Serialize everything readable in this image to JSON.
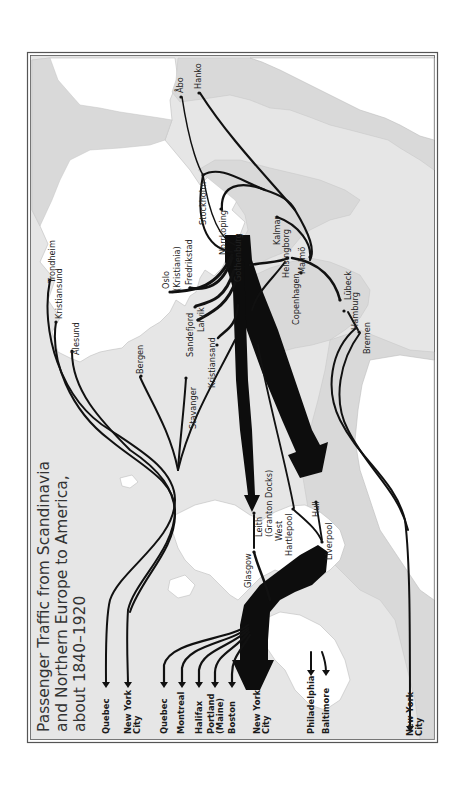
{
  "map": {
    "title_lines": [
      "Passenger Traffic from Scandinavia",
      "and Northern Europe to America,",
      "about 1840–1920"
    ],
    "orientation": "rotated 90° counter-clockwise",
    "colors": {
      "sea": "#e6e6e6",
      "land_scandinavia": "#ffffff",
      "land_continent": "#d9d9d9",
      "routes": "#111111",
      "frame": "#555555"
    },
    "ports": {
      "finland": [
        "Åbo",
        "Hanko"
      ],
      "sweden": [
        "Stockholm",
        "Norrköping",
        "Gothenburg",
        "Kalmar",
        "Helsingborg",
        "Malmö"
      ],
      "denmark": [
        "Copenhagen"
      ],
      "germany": [
        "Lübeck",
        "Hamburg",
        "Bremen"
      ],
      "norway": [
        "Trondheim",
        "Kristiansund",
        "Ålesund",
        "Bergen",
        "Stavanger",
        "Kristiansand",
        "Larvik",
        "Sandefjord",
        "Fredrikstad"
      ],
      "oslo": "Oslo",
      "oslo_alt": "(Kristiania)",
      "britain": [
        "Glasgow",
        "Leith",
        "(Granton Docks)",
        "West",
        "Hartlepool",
        "Hull",
        "Liverpool"
      ]
    },
    "destinations": {
      "group1": [
        "Quebec",
        "New York",
        "City"
      ],
      "group2": [
        "Quebec",
        "Montreal",
        "Halifax",
        "Portland",
        "(Maine)",
        "Boston"
      ],
      "main": [
        "New York",
        "City"
      ],
      "group3": [
        "Philadelphia",
        "Baltimore"
      ],
      "far": [
        "New York",
        "City"
      ]
    }
  }
}
